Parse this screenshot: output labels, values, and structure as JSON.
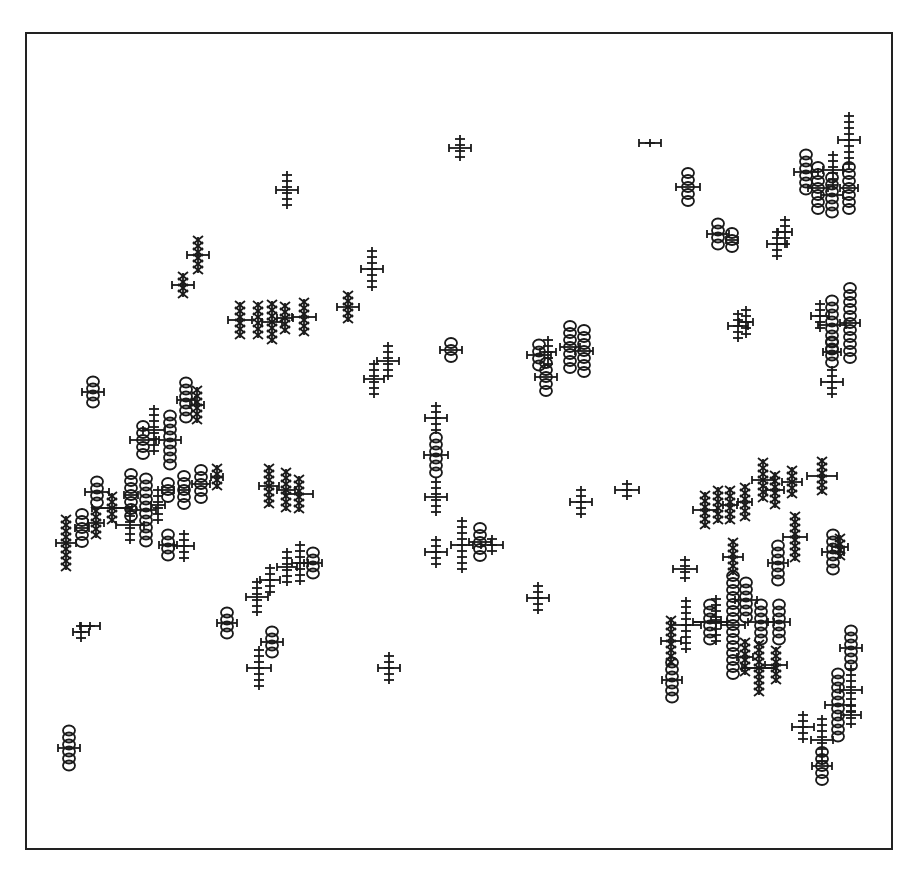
{
  "chart_data": {
    "type": "scatter",
    "title": "",
    "xlabel": "",
    "ylabel": "",
    "grid": false,
    "legend": null,
    "frame": {
      "x": 25,
      "y": 32,
      "width": 868,
      "height": 818
    },
    "marker_types": {
      "plus": "tick stack",
      "circle": "stacked circles",
      "cross": "stacked x marks"
    },
    "glyphs": [
      {
        "x": 460,
        "y": 148,
        "type": "plus",
        "n": 4,
        "bar": 22
      },
      {
        "x": 650,
        "y": 143,
        "type": "plus",
        "n": 1,
        "bar": 22
      },
      {
        "x": 287,
        "y": 190,
        "type": "plus",
        "n": 6,
        "bar": 22
      },
      {
        "x": 688,
        "y": 187,
        "type": "circle",
        "n": 5,
        "bar": 24
      },
      {
        "x": 718,
        "y": 234,
        "type": "circle",
        "n": 4,
        "bar": 22
      },
      {
        "x": 732,
        "y": 240,
        "type": "circle",
        "n": 3,
        "bar": 12
      },
      {
        "x": 777,
        "y": 244,
        "type": "plus",
        "n": 5,
        "bar": 20
      },
      {
        "x": 785,
        "y": 232,
        "type": "plus",
        "n": 5,
        "bar": 14
      },
      {
        "x": 806,
        "y": 172,
        "type": "circle",
        "n": 6,
        "bar": 24
      },
      {
        "x": 818,
        "y": 188,
        "type": "circle",
        "n": 7,
        "bar": 20
      },
      {
        "x": 832,
        "y": 195,
        "type": "circle",
        "n": 6,
        "bar": 22
      },
      {
        "x": 833,
        "y": 170,
        "type": "plus",
        "n": 6,
        "bar": 20
      },
      {
        "x": 849,
        "y": 140,
        "type": "plus",
        "n": 9,
        "bar": 22
      },
      {
        "x": 849,
        "y": 188,
        "type": "circle",
        "n": 7,
        "bar": 18
      },
      {
        "x": 198,
        "y": 255,
        "type": "cross",
        "n": 6,
        "bar": 22
      },
      {
        "x": 183,
        "y": 285,
        "type": "cross",
        "n": 4,
        "bar": 22
      },
      {
        "x": 372,
        "y": 269,
        "type": "plus",
        "n": 7,
        "bar": 22
      },
      {
        "x": 348,
        "y": 307,
        "type": "cross",
        "n": 5,
        "bar": 22
      },
      {
        "x": 240,
        "y": 320,
        "type": "cross",
        "n": 6,
        "bar": 24
      },
      {
        "x": 258,
        "y": 320,
        "type": "cross",
        "n": 6,
        "bar": 0
      },
      {
        "x": 272,
        "y": 322,
        "type": "cross",
        "n": 7,
        "bar": 20
      },
      {
        "x": 285,
        "y": 318,
        "type": "cross",
        "n": 5,
        "bar": 16
      },
      {
        "x": 304,
        "y": 317,
        "type": "cross",
        "n": 6,
        "bar": 24
      },
      {
        "x": 388,
        "y": 361,
        "type": "plus",
        "n": 6,
        "bar": 22
      },
      {
        "x": 374,
        "y": 379,
        "type": "plus",
        "n": 6,
        "bar": 20
      },
      {
        "x": 451,
        "y": 350,
        "type": "circle",
        "n": 3,
        "bar": 22
      },
      {
        "x": 539,
        "y": 355,
        "type": "circle",
        "n": 4,
        "bar": 24
      },
      {
        "x": 548,
        "y": 352,
        "type": "plus",
        "n": 5,
        "bar": 16
      },
      {
        "x": 546,
        "y": 377,
        "type": "circle",
        "n": 5,
        "bar": 22
      },
      {
        "x": 570,
        "y": 347,
        "type": "circle",
        "n": 7,
        "bar": 20
      },
      {
        "x": 584,
        "y": 351,
        "type": "circle",
        "n": 7,
        "bar": 18
      },
      {
        "x": 738,
        "y": 326,
        "type": "plus",
        "n": 5,
        "bar": 20
      },
      {
        "x": 746,
        "y": 322,
        "type": "plus",
        "n": 5,
        "bar": 14
      },
      {
        "x": 820,
        "y": 316,
        "type": "plus",
        "n": 5,
        "bar": 18
      },
      {
        "x": 832,
        "y": 325,
        "type": "circle",
        "n": 8,
        "bar": 28
      },
      {
        "x": 850,
        "y": 323,
        "type": "circle",
        "n": 11,
        "bar": 20
      },
      {
        "x": 832,
        "y": 352,
        "type": "circle",
        "n": 4,
        "bar": 18
      },
      {
        "x": 832,
        "y": 382,
        "type": "plus",
        "n": 5,
        "bar": 22
      },
      {
        "x": 93,
        "y": 392,
        "type": "circle",
        "n": 4,
        "bar": 22
      },
      {
        "x": 186,
        "y": 400,
        "type": "circle",
        "n": 6,
        "bar": 18
      },
      {
        "x": 197,
        "y": 405,
        "type": "cross",
        "n": 6,
        "bar": 14
      },
      {
        "x": 143,
        "y": 440,
        "type": "circle",
        "n": 5,
        "bar": 26
      },
      {
        "x": 154,
        "y": 430,
        "type": "plus",
        "n": 8,
        "bar": 22
      },
      {
        "x": 170,
        "y": 440,
        "type": "circle",
        "n": 8,
        "bar": 22
      },
      {
        "x": 436,
        "y": 418,
        "type": "plus",
        "n": 5,
        "bar": 22
      },
      {
        "x": 436,
        "y": 455,
        "type": "circle",
        "n": 6,
        "bar": 24
      },
      {
        "x": 436,
        "y": 497,
        "type": "plus",
        "n": 6,
        "bar": 22
      },
      {
        "x": 97,
        "y": 492,
        "type": "circle",
        "n": 4,
        "bar": 24
      },
      {
        "x": 131,
        "y": 495,
        "type": "circle",
        "n": 7,
        "bar": 14
      },
      {
        "x": 146,
        "y": 510,
        "type": "circle",
        "n": 10,
        "bar": 20
      },
      {
        "x": 158,
        "y": 505,
        "type": "plus",
        "n": 6,
        "bar": 14
      },
      {
        "x": 168,
        "y": 490,
        "type": "circle",
        "n": 3,
        "bar": 12
      },
      {
        "x": 184,
        "y": 490,
        "type": "circle",
        "n": 5,
        "bar": 10
      },
      {
        "x": 201,
        "y": 484,
        "type": "circle",
        "n": 5,
        "bar": 18
      },
      {
        "x": 217,
        "y": 477,
        "type": "cross",
        "n": 4,
        "bar": 12
      },
      {
        "x": 112,
        "y": 508,
        "type": "cross",
        "n": 5,
        "bar": 40
      },
      {
        "x": 96,
        "y": 523,
        "type": "cross",
        "n": 5,
        "bar": 16
      },
      {
        "x": 82,
        "y": 528,
        "type": "circle",
        "n": 5,
        "bar": 14
      },
      {
        "x": 66,
        "y": 543,
        "type": "cross",
        "n": 9,
        "bar": 20
      },
      {
        "x": 130,
        "y": 525,
        "type": "plus",
        "n": 6,
        "bar": 28
      },
      {
        "x": 168,
        "y": 545,
        "type": "circle",
        "n": 4,
        "bar": 18
      },
      {
        "x": 184,
        "y": 546,
        "type": "plus",
        "n": 5,
        "bar": 20
      },
      {
        "x": 269,
        "y": 486,
        "type": "cross",
        "n": 7,
        "bar": 20
      },
      {
        "x": 286,
        "y": 490,
        "type": "cross",
        "n": 7,
        "bar": 18
      },
      {
        "x": 299,
        "y": 494,
        "type": "cross",
        "n": 6,
        "bar": 28
      },
      {
        "x": 581,
        "y": 502,
        "type": "plus",
        "n": 5,
        "bar": 22
      },
      {
        "x": 627,
        "y": 490,
        "type": "plus",
        "n": 3,
        "bar": 24
      },
      {
        "x": 436,
        "y": 552,
        "type": "plus",
        "n": 5,
        "bar": 22
      },
      {
        "x": 462,
        "y": 545,
        "type": "plus",
        "n": 9,
        "bar": 22
      },
      {
        "x": 480,
        "y": 542,
        "type": "circle",
        "n": 5,
        "bar": 22
      },
      {
        "x": 492,
        "y": 545,
        "type": "plus",
        "n": 3,
        "bar": 22
      },
      {
        "x": 300,
        "y": 563,
        "type": "plus",
        "n": 7,
        "bar": 16
      },
      {
        "x": 313,
        "y": 563,
        "type": "circle",
        "n": 4,
        "bar": 18
      },
      {
        "x": 287,
        "y": 567,
        "type": "plus",
        "n": 6,
        "bar": 20
      },
      {
        "x": 270,
        "y": 580,
        "type": "plus",
        "n": 5,
        "bar": 20
      },
      {
        "x": 257,
        "y": 597,
        "type": "plus",
        "n": 6,
        "bar": 22
      },
      {
        "x": 538,
        "y": 598,
        "type": "plus",
        "n": 5,
        "bar": 22
      },
      {
        "x": 705,
        "y": 510,
        "type": "cross",
        "n": 6,
        "bar": 24
      },
      {
        "x": 718,
        "y": 505,
        "type": "cross",
        "n": 6,
        "bar": 0
      },
      {
        "x": 730,
        "y": 505,
        "type": "cross",
        "n": 6,
        "bar": 14
      },
      {
        "x": 745,
        "y": 502,
        "type": "cross",
        "n": 6,
        "bar": 14
      },
      {
        "x": 763,
        "y": 480,
        "type": "cross",
        "n": 7,
        "bar": 22
      },
      {
        "x": 775,
        "y": 490,
        "type": "cross",
        "n": 6,
        "bar": 18
      },
      {
        "x": 792,
        "y": 482,
        "type": "cross",
        "n": 5,
        "bar": 20
      },
      {
        "x": 822,
        "y": 476,
        "type": "cross",
        "n": 6,
        "bar": 30
      },
      {
        "x": 685,
        "y": 569,
        "type": "plus",
        "n": 4,
        "bar": 24
      },
      {
        "x": 733,
        "y": 557,
        "type": "cross",
        "n": 6,
        "bar": 20
      },
      {
        "x": 778,
        "y": 563,
        "type": "circle",
        "n": 6,
        "bar": 20
      },
      {
        "x": 795,
        "y": 537,
        "type": "cross",
        "n": 8,
        "bar": 24
      },
      {
        "x": 833,
        "y": 552,
        "type": "circle",
        "n": 6,
        "bar": 22
      },
      {
        "x": 840,
        "y": 547,
        "type": "cross",
        "n": 4,
        "bar": 16
      },
      {
        "x": 671,
        "y": 641,
        "type": "cross",
        "n": 8,
        "bar": 20
      },
      {
        "x": 686,
        "y": 625,
        "type": "plus",
        "n": 9,
        "bar": 30
      },
      {
        "x": 710,
        "y": 622,
        "type": "circle",
        "n": 6,
        "bar": 34
      },
      {
        "x": 716,
        "y": 620,
        "type": "plus",
        "n": 8,
        "bar": 10
      },
      {
        "x": 733,
        "y": 625,
        "type": "circle",
        "n": 15,
        "bar": 24
      },
      {
        "x": 746,
        "y": 600,
        "type": "circle",
        "n": 6,
        "bar": 22
      },
      {
        "x": 761,
        "y": 622,
        "type": "circle",
        "n": 6,
        "bar": 26
      },
      {
        "x": 779,
        "y": 622,
        "type": "circle",
        "n": 6,
        "bar": 22
      },
      {
        "x": 745,
        "y": 657,
        "type": "cross",
        "n": 6,
        "bar": 16
      },
      {
        "x": 759,
        "y": 668,
        "type": "cross",
        "n": 9,
        "bar": 34
      },
      {
        "x": 776,
        "y": 665,
        "type": "cross",
        "n": 6,
        "bar": 22
      },
      {
        "x": 672,
        "y": 680,
        "type": "circle",
        "n": 6,
        "bar": 20
      },
      {
        "x": 851,
        "y": 648,
        "type": "circle",
        "n": 6,
        "bar": 22
      },
      {
        "x": 851,
        "y": 690,
        "type": "plus",
        "n": 8,
        "bar": 22
      },
      {
        "x": 838,
        "y": 705,
        "type": "circle",
        "n": 10,
        "bar": 26
      },
      {
        "x": 851,
        "y": 715,
        "type": "plus",
        "n": 4,
        "bar": 20
      },
      {
        "x": 803,
        "y": 727,
        "type": "plus",
        "n": 5,
        "bar": 22
      },
      {
        "x": 822,
        "y": 740,
        "type": "plus",
        "n": 8,
        "bar": 22
      },
      {
        "x": 822,
        "y": 766,
        "type": "circle",
        "n": 5,
        "bar": 20
      },
      {
        "x": 81,
        "y": 632,
        "type": "plus",
        "n": 3,
        "bar": 16
      },
      {
        "x": 90,
        "y": 626,
        "type": "plus",
        "n": 1,
        "bar": 20
      },
      {
        "x": 227,
        "y": 623,
        "type": "circle",
        "n": 4,
        "bar": 20
      },
      {
        "x": 272,
        "y": 642,
        "type": "circle",
        "n": 4,
        "bar": 22
      },
      {
        "x": 259,
        "y": 668,
        "type": "plus",
        "n": 7,
        "bar": 24
      },
      {
        "x": 389,
        "y": 668,
        "type": "plus",
        "n": 5,
        "bar": 22
      },
      {
        "x": 69,
        "y": 748,
        "type": "circle",
        "n": 6,
        "bar": 22
      }
    ]
  }
}
